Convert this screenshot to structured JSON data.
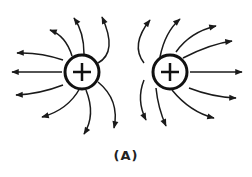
{
  "diagram": {
    "charges": [
      {
        "id": "left",
        "sign": "+",
        "cx": 82,
        "cy": 72,
        "r": 17
      },
      {
        "id": "right",
        "sign": "+",
        "cx": 170,
        "cy": 72,
        "r": 17
      }
    ],
    "caption": "(A)",
    "line_color": "#1a1a1a"
  }
}
